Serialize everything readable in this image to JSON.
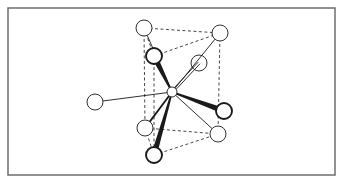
{
  "figure": {
    "frame": {
      "x": 8,
      "y": 8,
      "w": 327,
      "h": 167,
      "stroke": "#6e6e6e"
    },
    "colors": {
      "line": "#1a1a1a",
      "dash": "#333333",
      "fill": "#ffffff"
    },
    "central_atom": {
      "id": "M",
      "cx": 172,
      "cy": 92,
      "r": 5
    },
    "atoms": [
      {
        "id": "prism-top-left",
        "cx": 144,
        "cy": 28,
        "r": 8,
        "bold": false
      },
      {
        "id": "prism-top-right",
        "cx": 220,
        "cy": 33,
        "r": 8,
        "bold": false
      },
      {
        "id": "prism-top-front",
        "cx": 154,
        "cy": 56,
        "r": 8,
        "bold": true
      },
      {
        "id": "cap-upper-right",
        "cx": 199,
        "cy": 63,
        "r": 8,
        "bold": false
      },
      {
        "id": "cap-left",
        "cx": 95,
        "cy": 102,
        "r": 8,
        "bold": false
      },
      {
        "id": "cap-right",
        "cx": 224,
        "cy": 111,
        "r": 8,
        "bold": true
      },
      {
        "id": "prism-bottom-left",
        "cx": 145,
        "cy": 128,
        "r": 8,
        "bold": false
      },
      {
        "id": "prism-bottom-right",
        "cx": 218,
        "cy": 134,
        "r": 8,
        "bold": false
      },
      {
        "id": "prism-bottom-front",
        "cx": 154,
        "cy": 155,
        "r": 8,
        "bold": true
      }
    ],
    "bonds": [
      {
        "to": "prism-top-left",
        "style": "thin"
      },
      {
        "to": "prism-top-right",
        "style": "thin"
      },
      {
        "to": "prism-top-front",
        "style": "wedge"
      },
      {
        "to": "cap-upper-right",
        "style": "double"
      },
      {
        "to": "cap-left",
        "style": "thin"
      },
      {
        "to": "cap-right",
        "style": "wedge"
      },
      {
        "to": "prism-bottom-left",
        "style": "medium"
      },
      {
        "to": "prism-bottom-right",
        "style": "thin"
      },
      {
        "to": "prism-bottom-front",
        "style": "wedge"
      }
    ],
    "prism_edges": [
      [
        "prism-top-left",
        "prism-top-right"
      ],
      [
        "prism-top-front",
        "prism-top-right"
      ],
      [
        "prism-top-left",
        "prism-top-front"
      ],
      [
        "prism-bottom-left",
        "prism-bottom-right"
      ],
      [
        "prism-bottom-front",
        "prism-bottom-right"
      ],
      [
        "prism-bottom-left",
        "prism-bottom-front"
      ],
      [
        "prism-top-left",
        "prism-bottom-left"
      ],
      [
        "prism-top-front",
        "prism-bottom-front"
      ],
      [
        "prism-top-right",
        "prism-bottom-right"
      ]
    ]
  }
}
